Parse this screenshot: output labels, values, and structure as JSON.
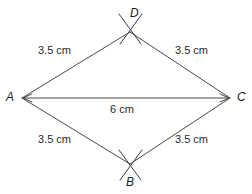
{
  "figure": {
    "type": "geometry-construction-diagram",
    "shape": "rhombus",
    "vertices": [
      {
        "id": "A",
        "label": "A",
        "x": 22,
        "y": 98,
        "position": "left"
      },
      {
        "id": "B",
        "label": "B",
        "x": 130,
        "y": 164,
        "position": "bottom"
      },
      {
        "id": "C",
        "label": "C",
        "x": 230,
        "y": 98,
        "position": "right"
      },
      {
        "id": "D",
        "label": "D",
        "x": 130,
        "y": 32,
        "position": "top"
      }
    ],
    "edges": [
      {
        "id": "AD",
        "from": "A",
        "to": "D",
        "length_label": "3.5 cm"
      },
      {
        "id": "DC",
        "from": "D",
        "to": "C",
        "length_label": "3.5 cm"
      },
      {
        "id": "AB",
        "from": "A",
        "to": "B",
        "length_label": "3.5 cm"
      },
      {
        "id": "BC",
        "from": "B",
        "to": "C",
        "length_label": "3.5 cm"
      }
    ],
    "diagonal": {
      "id": "AC",
      "from": "A",
      "to": "C",
      "length_label": "6 cm",
      "has_arrowheads": true
    },
    "construction_arcs": [
      {
        "at_vertex": "D",
        "style": "crossing-arcs"
      },
      {
        "at_vertex": "B",
        "style": "crossing-arcs"
      }
    ],
    "labels": {
      "vertex_a": "A",
      "vertex_b": "B",
      "vertex_c": "C",
      "vertex_d": "D",
      "side_top_left": "3.5 cm",
      "side_top_right": "3.5 cm",
      "side_bottom_left": "3.5 cm",
      "side_bottom_right": "3.5 cm",
      "diagonal_ac": "6 cm"
    },
    "colors": {
      "line": "#4a4a4a",
      "arc": "#3a3a3a",
      "text": "#1c1c1c",
      "background": "#ffffff"
    }
  }
}
